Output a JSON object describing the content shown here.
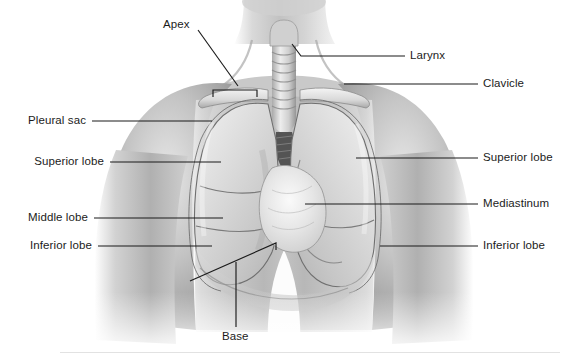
{
  "figure": {
    "style": "grayscale-medical-illustration",
    "width": 569,
    "height": 358,
    "background_color": "#ffffff",
    "label_color": "#1b1b1b",
    "leader_color": "#1b1b1b",
    "skin_light": "#e8e8e8",
    "skin_mid": "#b9b9b9",
    "skin_dark": "#8d8d8d",
    "lung_light": "#dedede",
    "lung_mid": "#c4c4c4",
    "outline": "#5a5a5a"
  },
  "labels": {
    "apex": "Apex",
    "larynx": "Larynx",
    "clavicle": "Clavicle",
    "pleural_sac": "Pleural sac",
    "superior_lobe_left": "Superior lobe",
    "superior_lobe_right": "Superior lobe",
    "middle_lobe": "Middle lobe",
    "inferior_lobe_left": "Inferior lobe",
    "inferior_lobe_right": "Inferior lobe",
    "mediastinum": "Mediastinum",
    "base": "Base"
  },
  "anatomy": {
    "structures": [
      "apex",
      "larynx",
      "trachea",
      "clavicle",
      "pleural sac",
      "superior lobe",
      "middle lobe",
      "inferior lobe",
      "mediastinum",
      "base",
      "diaphragm"
    ]
  }
}
